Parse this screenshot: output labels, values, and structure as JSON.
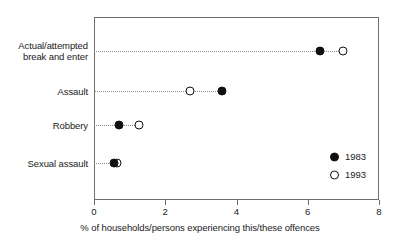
{
  "chart_data": {
    "type": "scatter",
    "title": "",
    "subtitle": "",
    "xlabel": "% of households/persons experiencing this/these offences",
    "ylabel": "",
    "xlim": [
      0,
      8
    ],
    "xticks": [
      0,
      2,
      4,
      6,
      8
    ],
    "xtick_labels": [
      "0",
      "2",
      "4",
      "6",
      "8"
    ],
    "grid": false,
    "leader_lines": "dotted",
    "legend_position": "inside-lower-right",
    "categories": [
      "Actual/attempted\nbreak and enter",
      "Assault",
      "Robbery",
      "Sexual assault"
    ],
    "series": [
      {
        "name": "1983",
        "marker": "filled-circle",
        "color": "#111111",
        "values": [
          6.35,
          3.6,
          0.7,
          0.55
        ]
      },
      {
        "name": "1993",
        "marker": "open-circle",
        "color": "#111111",
        "values": [
          7.0,
          2.7,
          1.25,
          0.65
        ]
      }
    ]
  },
  "axis": {
    "line_color": "#6e6e6e"
  },
  "legend": {
    "entries": [
      {
        "label": "1983",
        "marker": "filled-circle"
      },
      {
        "label": "1993",
        "marker": "open-circle"
      }
    ]
  }
}
